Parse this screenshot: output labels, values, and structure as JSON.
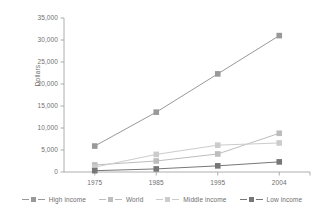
{
  "chart_data": {
    "type": "line",
    "title": "",
    "xlabel": "",
    "ylabel": "Dollars",
    "categories": [
      "1975",
      "1985",
      "1995",
      "2004"
    ],
    "ylim": [
      0,
      35000
    ],
    "yticks": [
      "0",
      "5,000",
      "10,000",
      "15,000",
      "20,000",
      "25,000",
      "30,000",
      "35,000"
    ],
    "ytick_values": [
      0,
      5000,
      10000,
      15000,
      20000,
      25000,
      30000,
      35000
    ],
    "grid": false,
    "legend_position": "bottom",
    "series": [
      {
        "name": "High income",
        "color": "#999999",
        "values": [
          5900,
          13600,
          22300,
          31000
        ]
      },
      {
        "name": "World",
        "color": "#bdbdbd",
        "values": [
          1600,
          2500,
          4100,
          8800
        ]
      },
      {
        "name": "Middle income",
        "color": "#cccccc",
        "values": [
          1100,
          4000,
          6100,
          6600
        ]
      },
      {
        "name": "Low income",
        "color": "#777777",
        "values": [
          300,
          700,
          1400,
          2300
        ]
      }
    ]
  },
  "axis": {
    "ylabel": "Dollars"
  },
  "legend": {
    "items": [
      {
        "label": "High income"
      },
      {
        "label": "World"
      },
      {
        "label": "Middle income"
      },
      {
        "label": "Low income"
      }
    ]
  }
}
